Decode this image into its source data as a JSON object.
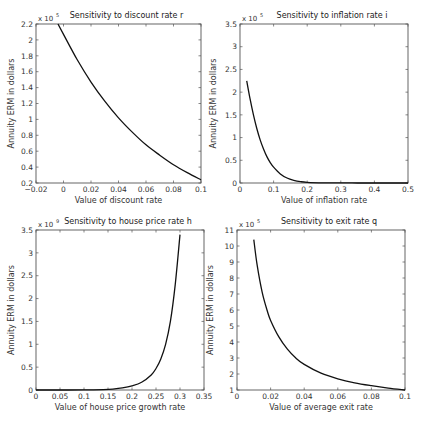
{
  "chart_data": [
    {
      "type": "line",
      "title": "Sensitivity to discount rate r",
      "xlabel": "Value of discount rate",
      "ylabel": "Annuity ERM in dollars",
      "y_multiplier": "x 10^5",
      "expo_base": "x 10",
      "expo_power": "5",
      "xlim": [
        -0.02,
        0.1
      ],
      "ylim": [
        0.2,
        2.2
      ],
      "xticks": [
        -0.02,
        0,
        0.02,
        0.04,
        0.06,
        0.08,
        0.1
      ],
      "xtick_labels": [
        "−0.02",
        "0",
        "0.02",
        "0.04",
        "0.06",
        "0.08",
        "0.1"
      ],
      "yticks": [
        0.2,
        0.4,
        0.6,
        0.8,
        1,
        1.2,
        1.4,
        1.6,
        1.8,
        2,
        2.2
      ],
      "ytick_labels": [
        "0.2",
        "0.4",
        "0.6",
        "0.8",
        "1",
        "1.2",
        "1.4",
        "1.6",
        "1.8",
        "2",
        "2.2"
      ],
      "series": [
        {
          "name": "ERM vs r",
          "x": [
            -0.004,
            0,
            0.01,
            0.02,
            0.03,
            0.04,
            0.05,
            0.06,
            0.07,
            0.08,
            0.09,
            0.1
          ],
          "y": [
            2.2,
            2.07,
            1.75,
            1.47,
            1.23,
            1.02,
            0.84,
            0.68,
            0.55,
            0.43,
            0.33,
            0.24
          ]
        }
      ],
      "grid": false
    },
    {
      "type": "line",
      "title": "Sensitivity to inflation rate i",
      "xlabel": "Value of inflation rate",
      "ylabel": "Annuity ERM in dollars",
      "y_multiplier": "x 10^5",
      "expo_base": "x 10",
      "expo_power": "5",
      "xlim": [
        0,
        0.5
      ],
      "ylim": [
        0,
        3.5
      ],
      "xticks": [
        0,
        0.1,
        0.2,
        0.3,
        0.4,
        0.5
      ],
      "xtick_labels": [
        "0",
        "0.1",
        "0.2",
        "0.3",
        "0.4",
        "0.5"
      ],
      "yticks": [
        0,
        0.5,
        1,
        1.5,
        2,
        2.5,
        3,
        3.5
      ],
      "ytick_labels": [
        "0",
        "0.5",
        "1",
        "1.5",
        "2",
        "2.5",
        "3",
        "3.5"
      ],
      "series": [
        {
          "name": "ERM vs i",
          "x": [
            0.02,
            0.03,
            0.04,
            0.05,
            0.06,
            0.07,
            0.08,
            0.09,
            0.1,
            0.12,
            0.14,
            0.16,
            0.18,
            0.2,
            0.25,
            0.3,
            0.35,
            0.4,
            0.45,
            0.5
          ],
          "y": [
            2.25,
            1.85,
            1.5,
            1.2,
            0.95,
            0.75,
            0.58,
            0.45,
            0.35,
            0.2,
            0.11,
            0.06,
            0.03,
            0.015,
            0.004,
            0.001,
            0.0005,
            0.0002,
            0.0001,
            0.0
          ]
        }
      ],
      "grid": false
    },
    {
      "type": "line",
      "title": "Sensitivity to house price rate h",
      "xlabel": "Value of house price growth rate",
      "ylabel": "Annuity ERM in dollars",
      "y_multiplier": "x 10^9",
      "expo_base": "x 10",
      "expo_power": "9",
      "xlim": [
        0,
        0.35
      ],
      "ylim": [
        0,
        3.5
      ],
      "xticks": [
        0,
        0.05,
        0.1,
        0.15,
        0.2,
        0.25,
        0.3,
        0.35
      ],
      "xtick_labels": [
        "0",
        "0.05",
        "0.1",
        "0.15",
        "0.2",
        "0.25",
        "0.3",
        "0.35"
      ],
      "yticks": [
        0,
        0.5,
        1,
        1.5,
        2,
        2.5,
        3,
        3.5
      ],
      "ytick_labels": [
        "0",
        "0.5",
        "1",
        "1.5",
        "2",
        "2.5",
        "3",
        "3.5"
      ],
      "series": [
        {
          "name": "ERM vs h",
          "x": [
            0,
            0.05,
            0.1,
            0.12,
            0.14,
            0.16,
            0.18,
            0.2,
            0.22,
            0.24,
            0.25,
            0.26,
            0.27,
            0.28,
            0.29,
            0.3
          ],
          "y": [
            0,
            0.0,
            0.001,
            0.003,
            0.008,
            0.02,
            0.045,
            0.09,
            0.17,
            0.33,
            0.47,
            0.68,
            1.0,
            1.5,
            2.3,
            3.4
          ]
        }
      ],
      "grid": false
    },
    {
      "type": "line",
      "title": "Sensitivity to exit rate q",
      "xlabel": "Value of average exit rate",
      "ylabel": "Annuity ERM in dollars",
      "y_multiplier": "x 10^5",
      "expo_base": "x 10",
      "expo_power": "5",
      "xlim": [
        0,
        0.1
      ],
      "ylim": [
        1,
        11
      ],
      "xticks": [
        0,
        0.02,
        0.04,
        0.06,
        0.08,
        0.1
      ],
      "xtick_labels": [
        "0",
        "0.02",
        "0.04",
        "0.06",
        "0.08",
        "0.1"
      ],
      "yticks": [
        1,
        2,
        3,
        4,
        5,
        6,
        7,
        8,
        9,
        10,
        11
      ],
      "ytick_labels": [
        "1",
        "2",
        "3",
        "4",
        "5",
        "6",
        "7",
        "8",
        "9",
        "10",
        "11"
      ],
      "series": [
        {
          "name": "ERM vs q",
          "x": [
            0.01,
            0.012,
            0.015,
            0.018,
            0.02,
            0.025,
            0.03,
            0.035,
            0.04,
            0.05,
            0.06,
            0.07,
            0.08,
            0.09,
            0.1
          ],
          "y": [
            10.4,
            8.8,
            7.1,
            5.95,
            5.35,
            4.3,
            3.55,
            3.0,
            2.6,
            2.05,
            1.7,
            1.45,
            1.27,
            1.12,
            1.0
          ]
        }
      ],
      "grid": false
    }
  ]
}
